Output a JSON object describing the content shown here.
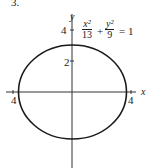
{
  "problem_number": "3.",
  "axes": {
    "x_label": "x",
    "y_label": "y",
    "y_ticks": [
      "4",
      "2"
    ],
    "x_ticks": [
      "4",
      "4"
    ]
  },
  "equation": {
    "term1_num": "x²",
    "term1_den": "13",
    "plus": "+",
    "term2_num": "y²",
    "term2_den": "9",
    "rhs": "= 1"
  },
  "ellipse": {
    "a_squared": 13,
    "b_squared": 9,
    "stroke": "#1a1a1a"
  }
}
